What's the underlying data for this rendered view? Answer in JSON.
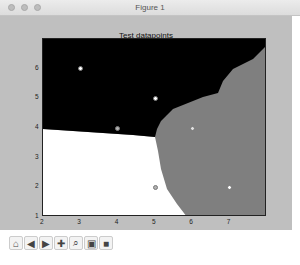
{
  "window": {
    "title": "Figure 1"
  },
  "toolbar": {
    "buttons": [
      {
        "name": "home-button",
        "icon": "home-icon",
        "glyph": "⌂"
      },
      {
        "name": "back-button",
        "icon": "back-arrow-icon",
        "glyph": "◀"
      },
      {
        "name": "forward-button",
        "icon": "forward-arrow-icon",
        "glyph": "▶"
      },
      {
        "name": "pan-button",
        "icon": "pan-icon",
        "glyph": "✚"
      },
      {
        "name": "zoom-button",
        "icon": "zoom-rect-icon",
        "glyph": "⌕"
      },
      {
        "name": "subplots-button",
        "icon": "subplots-config-icon",
        "glyph": "▣"
      },
      {
        "name": "save-button",
        "icon": "save-icon",
        "glyph": "■"
      }
    ]
  },
  "chart_data": {
    "type": "scatter",
    "title": "Test datapoints",
    "xlabel": "",
    "ylabel": "",
    "xlim": [
      2,
      8
    ],
    "ylim": [
      1,
      7
    ],
    "x_ticks": [
      "2",
      "3",
      "4",
      "5",
      "6",
      "7"
    ],
    "y_ticks": [
      "1",
      "2",
      "3",
      "4",
      "5",
      "6"
    ],
    "grid": false,
    "background": "decision regions (black: upper-left, white: lower-left, gray: right)",
    "regions": [
      {
        "name": "class-black",
        "color": "#000000"
      },
      {
        "name": "class-white",
        "color": "#ffffff"
      },
      {
        "name": "class-gray",
        "color": "#7f7f7f"
      }
    ],
    "points": [
      {
        "x": 3,
        "y": 6,
        "color": "#ffffff"
      },
      {
        "x": 5,
        "y": 5,
        "color": "#ffffff"
      },
      {
        "x": 4,
        "y": 4,
        "color": "#b0b0b0"
      },
      {
        "x": 6,
        "y": 4,
        "color": "#e0e0e0"
      },
      {
        "x": 5,
        "y": 2,
        "color": "#b0b0b0"
      },
      {
        "x": 7,
        "y": 2,
        "color": "#ffffff"
      }
    ]
  }
}
